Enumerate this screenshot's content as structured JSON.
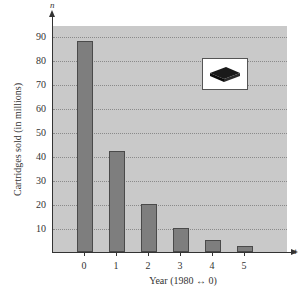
{
  "chart_data": {
    "type": "bar",
    "title": "",
    "xlabel": "Year (1980 ↔ 0)",
    "ylabel": "Cartridges sold (in millions)",
    "x_axis_variable": "t",
    "y_axis_variable": "n",
    "categories": [
      "0",
      "1",
      "2",
      "3",
      "4",
      "5"
    ],
    "values": [
      88,
      42,
      20,
      10,
      5,
      2.5
    ],
    "yticks": [
      "10",
      "20",
      "30",
      "40",
      "50",
      "60",
      "70",
      "80",
      "90"
    ],
    "ylim": [
      0,
      95
    ],
    "grid": true,
    "legend": null,
    "inset_image": "game-cartridge"
  },
  "labels": {
    "xlabel": "Year (1980 ↔ 0)",
    "ylabel": "Cartridges sold (in millions)",
    "x_var": "t",
    "y_var": "n",
    "yticks": [
      "90",
      "80",
      "70",
      "60",
      "50",
      "40",
      "30",
      "20",
      "10"
    ],
    "xticks": [
      "0",
      "1",
      "2",
      "3",
      "4",
      "5"
    ]
  }
}
